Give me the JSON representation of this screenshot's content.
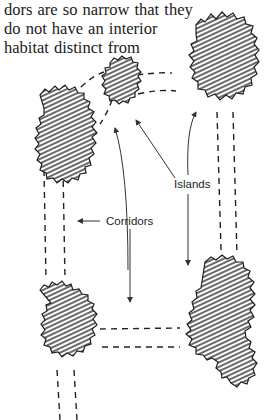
{
  "text_lines": [
    "dors are so narrow that they",
    "do not have an interior",
    "habitat distinct from"
  ],
  "figure": {
    "labels": {
      "islands": "Islands",
      "corridors": "Corridors"
    },
    "elements": {
      "islands_count": 5,
      "corridor_style": "dashed double lines",
      "island_style": "hatched irregular patches"
    },
    "colors": {
      "ink": "#222222",
      "background": "#ffffff"
    }
  }
}
